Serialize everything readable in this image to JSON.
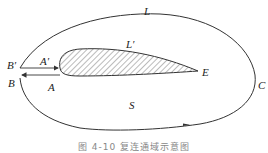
{
  "figure": {
    "caption": "图 4-10  复连通域示意图",
    "labels": {
      "L": "L",
      "L_prime": "L′",
      "A": "A",
      "A_prime": "A′",
      "B": "B",
      "B_prime": "B′",
      "C": "C",
      "E": "E",
      "S": "S"
    },
    "colors": {
      "stroke": "#333333",
      "hatch": "#555555",
      "caption": "#888888"
    }
  }
}
